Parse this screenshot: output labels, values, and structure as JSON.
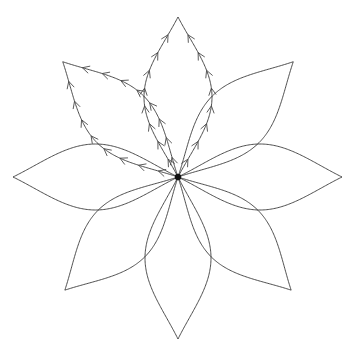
{
  "figure": {
    "type": "diagram",
    "background_color": "#ffffff",
    "stroke_color": "#3a3a3a",
    "arrow_color": "#4a4a4a",
    "center_color": "#111111",
    "stroke_width": 0.9,
    "arrow_stroke_width": 0.9,
    "width": 357,
    "height": 353,
    "center": {
      "x": 178,
      "y": 177
    },
    "petal_count": 8,
    "petal_length": 166,
    "petal_width": 62,
    "center_dot_radius": 3.2
  },
  "chart_data": {
    "type": "line",
    "xlabel": "",
    "ylabel": "",
    "grid": false,
    "legend": null,
    "xlim": [
      0,
      357
    ],
    "ylim": [
      0,
      353
    ],
    "center": [
      178,
      177
    ],
    "petals": [
      {
        "name": "petal-up",
        "angle_deg": -90,
        "tip": [
          173,
          18
        ],
        "length": 160,
        "half_width": 34,
        "arrows": true,
        "arrow_count_per_edge": 8,
        "arrow_direction": "outward"
      },
      {
        "name": "petal-upper-left",
        "angle_deg": -135,
        "tip": [
          63,
          65
        ],
        "length": 163,
        "half_width": 33,
        "arrows": true,
        "arrow_count_per_edge": 8,
        "arrow_direction": "outward"
      },
      {
        "name": "petal-left",
        "angle_deg": 180,
        "tip": [
          14,
          180
        ],
        "length": 165,
        "half_width": 33,
        "arrows": false,
        "arrow_count_per_edge": 0,
        "arrow_direction": "none"
      },
      {
        "name": "petal-lower-left",
        "angle_deg": 135,
        "tip": [
          65,
          288
        ],
        "length": 160,
        "half_width": 33,
        "arrows": false,
        "arrow_count_per_edge": 0,
        "arrow_direction": "none"
      },
      {
        "name": "petal-down",
        "angle_deg": 90,
        "tip": [
          180,
          338
        ],
        "length": 162,
        "half_width": 33,
        "arrows": false,
        "arrow_count_per_edge": 0,
        "arrow_direction": "none"
      },
      {
        "name": "petal-lower-right",
        "angle_deg": 45,
        "tip": [
          292,
          288
        ],
        "length": 160,
        "half_width": 33,
        "arrows": false,
        "arrow_count_per_edge": 0,
        "arrow_direction": "none"
      },
      {
        "name": "petal-right",
        "angle_deg": 0,
        "tip": [
          342,
          177
        ],
        "length": 164,
        "half_width": 33,
        "arrows": false,
        "arrow_count_per_edge": 0,
        "arrow_direction": "none"
      },
      {
        "name": "petal-upper-right",
        "angle_deg": -45,
        "tip": [
          293,
          65
        ],
        "length": 163,
        "half_width": 33,
        "arrows": false,
        "arrow_count_per_edge": 0,
        "arrow_direction": "none"
      }
    ],
    "annotations": [
      {
        "name": "center-singularity",
        "position": [
          178,
          177
        ],
        "marker": "filled-dot",
        "label": ""
      }
    ]
  }
}
